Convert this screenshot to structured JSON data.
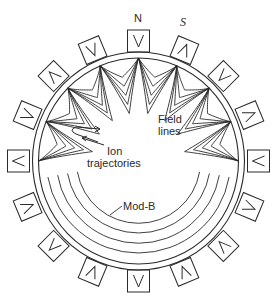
{
  "diagram": {
    "type": "multipole-ion-confinement-cross-section",
    "colors": {
      "line": "#2a2a2a",
      "background": "#ffffff"
    },
    "geometry": {
      "center": [
        138.5,
        161
      ],
      "outer_ring": {
        "rx": 106,
        "ry": 109
      },
      "inner_ring": {
        "rx": 100,
        "ry": 103
      },
      "magnet_radius": 120,
      "magnet_size": 22,
      "magnet_count": 16,
      "cusp_angles_deg": [
        -90,
        -67.5,
        -45,
        -22.5,
        0,
        22.5,
        45,
        67.5,
        90
      ],
      "field_line_layers": 5,
      "modb_contours": [
        {
          "rx": 92,
          "ry": 92,
          "start_deg": 100,
          "end_deg": 260
        },
        {
          "rx": 82,
          "ry": 82,
          "start_deg": 100,
          "end_deg": 260
        },
        {
          "rx": 72,
          "ry": 72,
          "start_deg": 100,
          "end_deg": 260
        },
        {
          "rx": 62,
          "ry": 62,
          "start_deg": 100,
          "end_deg": 260
        }
      ]
    },
    "magnets": [
      {
        "angle": 0,
        "glyph": "V"
      },
      {
        "angle": 22.5,
        "glyph": "Λ"
      },
      {
        "angle": 45,
        "glyph": "V"
      },
      {
        "angle": 67.5,
        "glyph": "Λ"
      },
      {
        "angle": 90,
        "glyph": "V"
      },
      {
        "angle": 112.5,
        "glyph": "Λ"
      },
      {
        "angle": 135,
        "glyph": "V"
      },
      {
        "angle": 157.5,
        "glyph": "V"
      },
      {
        "angle": 180,
        "glyph": "Λ"
      },
      {
        "angle": 202.5,
        "glyph": "V"
      },
      {
        "angle": 225,
        "glyph": "Λ"
      },
      {
        "angle": 247.5,
        "glyph": "V"
      },
      {
        "angle": 270,
        "glyph": "Λ"
      },
      {
        "angle": 292.5,
        "glyph": "V"
      },
      {
        "angle": 315,
        "glyph": "Λ"
      },
      {
        "angle": 337.5,
        "glyph": "V"
      }
    ],
    "labels": {
      "north": "N",
      "south": "S",
      "field_lines_1": "Field",
      "field_lines_2": "lines",
      "ion_1": "Ion",
      "ion_2": "trajectories",
      "mod_b": "Mod-B"
    }
  }
}
